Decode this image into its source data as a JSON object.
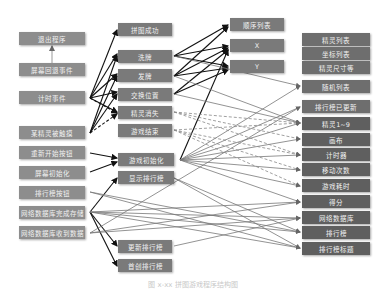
{
  "diagram": {
    "left_column": [
      {
        "id": "L1",
        "label": "退出程序"
      },
      {
        "id": "L2",
        "label": "屏幕回退事件"
      },
      {
        "id": "L3",
        "label": "计时事件"
      },
      {
        "id": "L4",
        "label": "某精灵被触摸"
      },
      {
        "id": "L5",
        "label": "重新开始按钮"
      },
      {
        "id": "L6",
        "label": "屏幕初始化"
      },
      {
        "id": "L7",
        "label": "排行榜按钮"
      },
      {
        "id": "L8",
        "label": "网络数据库完成存储"
      },
      {
        "id": "L9",
        "label": "网络数据库收到数据"
      }
    ],
    "middle_column": [
      {
        "id": "M1",
        "label": "拼图成功"
      },
      {
        "id": "M2",
        "label": "洗牌"
      },
      {
        "id": "M3",
        "label": "发牌"
      },
      {
        "id": "M4",
        "label": "交换位置"
      },
      {
        "id": "M5",
        "label": "精灵消失"
      },
      {
        "id": "M6",
        "label": "游戏结束"
      },
      {
        "id": "M7",
        "label": "游戏初始化"
      },
      {
        "id": "M8",
        "label": "显示排行榜"
      },
      {
        "id": "M9",
        "label": "更新排行榜"
      },
      {
        "id": "M10",
        "label": "首创排行榜"
      }
    ],
    "procedure_args": [
      {
        "id": "P1",
        "label": "顺序列表"
      },
      {
        "id": "P2",
        "label": "X"
      },
      {
        "id": "P3",
        "label": "Y"
      }
    ],
    "right_group_1": [
      {
        "id": "R1",
        "label": "精灵列表"
      },
      {
        "id": "R2",
        "label": "坐标列表"
      },
      {
        "id": "R3",
        "label": "精灵尺寸等"
      }
    ],
    "right_column": [
      {
        "id": "R4",
        "label": "随机列表"
      },
      {
        "id": "R5",
        "label": "排行榜已更新"
      },
      {
        "id": "R6",
        "label": "精灵1~9"
      },
      {
        "id": "R7",
        "label": "画布"
      },
      {
        "id": "R8",
        "label": "计时器"
      },
      {
        "id": "R9",
        "label": "移动次数"
      },
      {
        "id": "R10",
        "label": "游戏耗时"
      },
      {
        "id": "R11",
        "label": "得分"
      },
      {
        "id": "R12",
        "label": "网络数据库"
      },
      {
        "id": "R13",
        "label": "排行榜"
      },
      {
        "id": "R14",
        "label": "排行榜标题"
      }
    ],
    "caption": "图 x-xx 拼图游戏程序结构图"
  }
}
